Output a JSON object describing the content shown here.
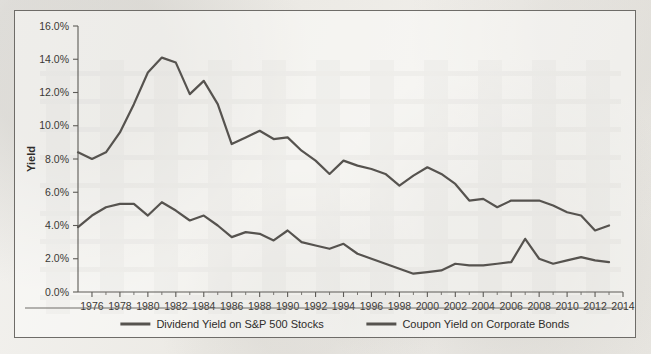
{
  "chart_data": {
    "type": "line",
    "title": "",
    "xlabel": "",
    "ylabel": "Yield",
    "xlim": [
      1975,
      2014
    ],
    "ylim": [
      0.0,
      16.0
    ],
    "y_tick_labels": [
      "0.0%",
      "2.0%",
      "4.0%",
      "6.0%",
      "8.0%",
      "10.0%",
      "12.0%",
      "14.0%",
      "16.0%"
    ],
    "y_tick_values": [
      0.0,
      2.0,
      4.0,
      6.0,
      8.0,
      10.0,
      12.0,
      14.0,
      16.0
    ],
    "x_tick_labels": [
      "1976",
      "1978",
      "1980",
      "1982",
      "1984",
      "1986",
      "1988",
      "1990",
      "1992",
      "1994",
      "1996",
      "1998",
      "2000",
      "2002",
      "2004",
      "2006",
      "2008",
      "2010",
      "2012",
      "2014"
    ],
    "x_tick_values": [
      1976,
      1978,
      1980,
      1982,
      1984,
      1986,
      1988,
      1990,
      1992,
      1994,
      1996,
      1998,
      2000,
      2002,
      2004,
      2006,
      2008,
      2010,
      2012,
      2014
    ],
    "x": [
      1975,
      1976,
      1977,
      1978,
      1979,
      1980,
      1981,
      1982,
      1983,
      1984,
      1985,
      1986,
      1987,
      1988,
      1989,
      1990,
      1991,
      1992,
      1993,
      1994,
      1995,
      1996,
      1997,
      1998,
      1999,
      2000,
      2001,
      2002,
      2003,
      2004,
      2005,
      2006,
      2007,
      2008,
      2009,
      2010,
      2011,
      2012,
      2013
    ],
    "grid": false,
    "legend_position": "bottom",
    "series": [
      {
        "name": "Dividend Yield on S&P 500 Stocks",
        "color": "#56534f",
        "values": [
          3.9,
          4.6,
          5.1,
          5.3,
          5.3,
          4.6,
          5.4,
          4.9,
          4.3,
          4.6,
          4.0,
          3.3,
          3.6,
          3.5,
          3.1,
          3.7,
          3.0,
          2.8,
          2.6,
          2.9,
          2.3,
          2.0,
          1.7,
          1.4,
          1.1,
          1.2,
          1.3,
          1.7,
          1.6,
          1.6,
          1.7,
          1.8,
          3.2,
          2.0,
          1.7,
          1.9,
          2.1,
          1.9,
          1.8
        ]
      },
      {
        "name": "Coupon Yield on Corporate Bonds",
        "color": "#56534f",
        "values": [
          8.4,
          8.0,
          8.4,
          9.6,
          11.3,
          13.2,
          14.1,
          13.8,
          11.9,
          12.7,
          11.3,
          8.9,
          9.3,
          9.7,
          9.2,
          9.3,
          8.5,
          7.9,
          7.1,
          7.9,
          7.6,
          7.4,
          7.1,
          6.4,
          7.0,
          7.5,
          7.1,
          6.5,
          5.5,
          5.6,
          5.1,
          5.5,
          5.5,
          5.5,
          5.2,
          4.8,
          4.6,
          3.7,
          4.0
        ]
      }
    ]
  },
  "legend": [
    {
      "label": "Dividend Yield on S&P 500 Stocks"
    },
    {
      "label": "Coupon Yield on Corporate Bonds"
    }
  ]
}
